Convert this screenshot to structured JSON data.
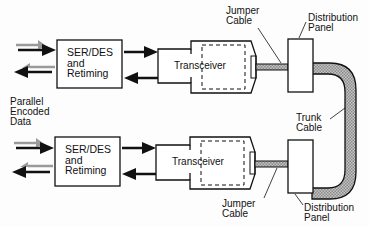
{
  "diagram": {
    "title": "",
    "colors": {
      "stroke": "#111111",
      "cable_fill": "#a8a8a8",
      "hatch_gray": "#9a9a9a",
      "background": "#fdfdfd"
    },
    "labels": {
      "parallel_data": [
        "Parallel",
        "Encoded",
        "Data"
      ],
      "top_serdes": [
        "SER/DES",
        "and",
        "Retiming"
      ],
      "bottom_serdes": [
        "SER/DES",
        "and",
        "Retiming"
      ],
      "top_transceiver": "Transceiver",
      "bottom_transceiver": "Transceiver",
      "top_jumper": [
        "Jumper",
        "Cable"
      ],
      "bottom_jumper": [
        "Jumper",
        "Cable"
      ],
      "top_panel": [
        "Distribution",
        "Panel"
      ],
      "bottom_panel": [
        "Distribution",
        "Panel"
      ],
      "trunk": [
        "Trunk",
        "Cable"
      ]
    },
    "nodes": [
      {
        "id": "top_serdes",
        "type": "box",
        "label": "SER/DES and Retiming"
      },
      {
        "id": "top_transceiver",
        "type": "transceiver",
        "label": "Transceiver"
      },
      {
        "id": "top_jumper",
        "type": "cable",
        "label": "Jumper Cable"
      },
      {
        "id": "top_panel",
        "type": "box",
        "label": "Distribution Panel"
      },
      {
        "id": "trunk",
        "type": "cable",
        "label": "Trunk Cable"
      },
      {
        "id": "bottom_panel",
        "type": "box",
        "label": "Distribution Panel"
      },
      {
        "id": "bottom_jumper",
        "type": "cable",
        "label": "Jumper Cable"
      },
      {
        "id": "bottom_transceiver",
        "type": "transceiver",
        "label": "Transceiver"
      },
      {
        "id": "bottom_serdes",
        "type": "box",
        "label": "SER/DES and Retiming"
      }
    ],
    "edges": [
      {
        "from": "parallel_in_top",
        "to": "top_serdes",
        "direction": "right"
      },
      {
        "from": "top_serdes",
        "to": "parallel_out_top",
        "direction": "left"
      },
      {
        "from": "top_serdes",
        "to": "top_transceiver",
        "direction": "right"
      },
      {
        "from": "top_transceiver",
        "to": "top_serdes",
        "direction": "left"
      },
      {
        "from": "top_transceiver",
        "to": "top_panel",
        "via": "top_jumper"
      },
      {
        "from": "top_panel",
        "to": "bottom_panel",
        "via": "trunk"
      },
      {
        "from": "bottom_panel",
        "to": "bottom_transceiver",
        "via": "bottom_jumper"
      },
      {
        "from": "parallel_in_bottom",
        "to": "bottom_serdes",
        "direction": "right"
      },
      {
        "from": "bottom_serdes",
        "to": "parallel_out_bottom",
        "direction": "left"
      },
      {
        "from": "bottom_serdes",
        "to": "bottom_transceiver",
        "direction": "right"
      },
      {
        "from": "bottom_transceiver",
        "to": "bottom_serdes",
        "direction": "left"
      }
    ]
  }
}
